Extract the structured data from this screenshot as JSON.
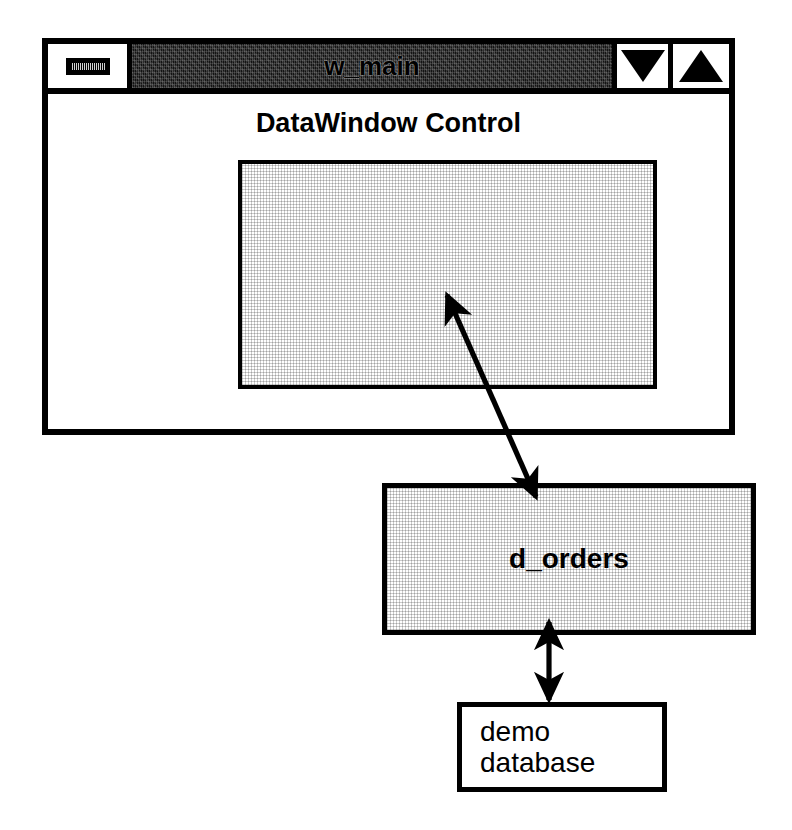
{
  "window": {
    "title": "w_main",
    "system_menu_icon": "window-menu-bar-icon",
    "minimize_icon": "triangle-down-icon",
    "maximize_icon": "triangle-up-icon",
    "client": {
      "datawindow_control_label": "DataWindow Control",
      "datawindow_control_fill": "#f2f2f2"
    }
  },
  "objects": {
    "datawindow_object": {
      "label": "d_orders",
      "fill": "#f2f2f2"
    },
    "database": {
      "line1": "demo",
      "line2": "database",
      "fill": "#ffffff"
    }
  },
  "connectors": [
    {
      "name": "control-to-object",
      "from": "d_orders",
      "to": "DataWindow Control",
      "style": "double-headed-arrow",
      "orientation": "diagonal"
    },
    {
      "name": "object-to-database",
      "from": "d_orders",
      "to": "demo database",
      "style": "double-headed-arrow",
      "orientation": "vertical"
    }
  ],
  "colors": {
    "ink": "#000000",
    "paper": "#ffffff",
    "title_bar": "#1a1a1a",
    "halftone": "#f2f2f2"
  }
}
